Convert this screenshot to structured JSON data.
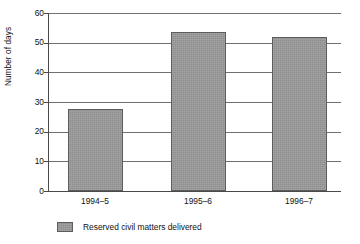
{
  "chart_data": {
    "type": "bar",
    "title": "",
    "xlabel": "",
    "ylabel": "Number of days",
    "categories": [
      "1994–5",
      "1995–6",
      "1996–7"
    ],
    "values": [
      27.5,
      53.5,
      52
    ],
    "series": [
      {
        "name": "Reserved civil matters delivered",
        "values": [
          27.5,
          53.5,
          52
        ]
      }
    ],
    "ylim": [
      0,
      60
    ],
    "yticks": [
      0,
      10,
      20,
      30,
      40,
      50,
      60
    ],
    "ytick_labels": [
      "0",
      "10",
      "20",
      "30",
      "40",
      "50",
      "60"
    ],
    "grid": "horizontal",
    "legend_position": "bottom-left",
    "legend": [
      {
        "label": "Reserved civil matters delivered",
        "color": "#9a9a9a"
      }
    ],
    "colors": {
      "bar_fill": "#9a9a9a",
      "bar_edge": "#5d5d5d",
      "gridline": "#707070",
      "axis": "#4a4a4a",
      "background": "#ffffff",
      "text": "#111111"
    }
  }
}
